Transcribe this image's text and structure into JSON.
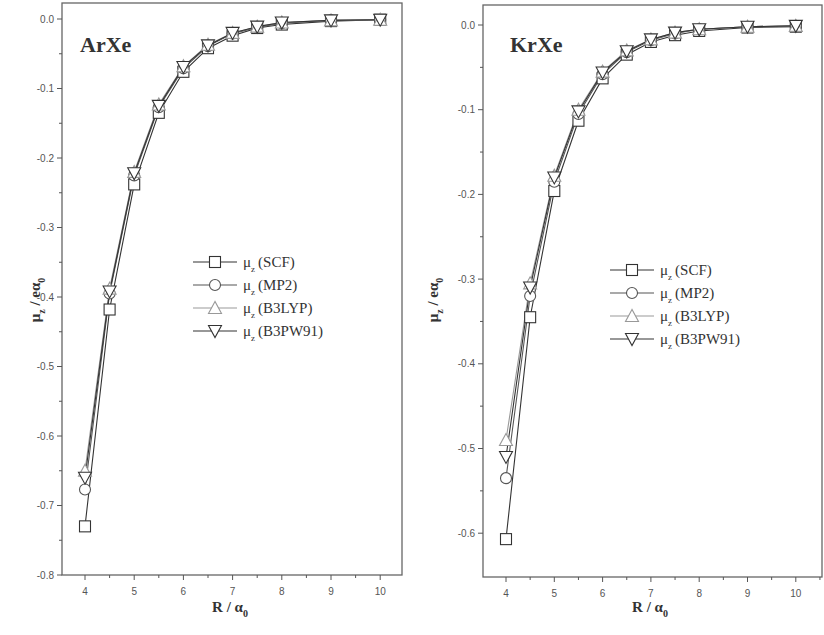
{
  "chart_data": [
    {
      "type": "line",
      "title": "ArXe",
      "xlabel": "R / α0",
      "ylabel": "μz / eα0",
      "xlim": [
        3.6,
        10.5
      ],
      "ylim": [
        -0.8,
        0.0
      ],
      "xticks": [
        4,
        5,
        6,
        7,
        8,
        9,
        10
      ],
      "yticks": [
        0.0,
        -0.1,
        -0.2,
        -0.3,
        -0.4,
        -0.5,
        -0.6,
        -0.7,
        -0.8
      ],
      "ytick_labels": [
        "0.0",
        "-0.1",
        "-0.2",
        "-0.3",
        "-0.4",
        "-0.5",
        "-0.6",
        "-0.7",
        "-0.8"
      ],
      "grid": false,
      "legend_position": "center-right",
      "x": [
        4.0,
        4.5,
        5.0,
        5.5,
        6.0,
        6.5,
        7.0,
        7.5,
        8.0,
        9.0,
        10.0
      ],
      "series": [
        {
          "name": "μz (SCF)",
          "marker": "square",
          "color": "#333333",
          "values": [
            -0.73,
            -0.418,
            -0.238,
            -0.135,
            -0.076,
            -0.042,
            -0.024,
            -0.013,
            -0.008,
            -0.003,
            -0.001
          ]
        },
        {
          "name": "μz (MP2)",
          "marker": "circle",
          "color": "#555555",
          "values": [
            -0.677,
            -0.395,
            -0.225,
            -0.127,
            -0.071,
            -0.039,
            -0.021,
            -0.012,
            -0.006,
            -0.002,
            -0.001
          ]
        },
        {
          "name": "μz (B3LYP)",
          "marker": "triangle-up",
          "color": "#999999",
          "values": [
            -0.65,
            -0.388,
            -0.22,
            -0.123,
            -0.068,
            -0.037,
            -0.02,
            -0.011,
            -0.005,
            -0.002,
            -0.001
          ]
        },
        {
          "name": "μz (B3PW91)",
          "marker": "triangle-down",
          "color": "#333333",
          "values": [
            -0.66,
            -0.392,
            -0.222,
            -0.125,
            -0.069,
            -0.038,
            -0.02,
            -0.011,
            -0.005,
            -0.002,
            -0.001
          ]
        }
      ]
    },
    {
      "type": "line",
      "title": "KrXe",
      "xlabel": "R / α0",
      "ylabel": "μz / eα0",
      "xlim": [
        3.6,
        10.5
      ],
      "ylim": [
        -0.65,
        0.02
      ],
      "xticks": [
        4,
        5,
        6,
        7,
        8,
        9,
        10
      ],
      "yticks": [
        0.0,
        -0.1,
        -0.2,
        -0.3,
        -0.4,
        -0.5,
        -0.6
      ],
      "ytick_labels": [
        "0.0",
        "-0.1",
        "-0.2",
        "-0.3",
        "-0.4",
        "-0.5",
        "-0.6"
      ],
      "grid": false,
      "legend_position": "center-right",
      "x": [
        4.0,
        4.5,
        5.0,
        5.5,
        6.0,
        6.5,
        7.0,
        7.5,
        8.0,
        9.0,
        10.0
      ],
      "series": [
        {
          "name": "μz (SCF)",
          "marker": "square",
          "color": "#333333",
          "values": [
            -0.607,
            -0.345,
            -0.196,
            -0.113,
            -0.063,
            -0.035,
            -0.02,
            -0.012,
            -0.007,
            -0.003,
            -0.002
          ]
        },
        {
          "name": "μz (MP2)",
          "marker": "circle",
          "color": "#555555",
          "values": [
            -0.535,
            -0.32,
            -0.185,
            -0.105,
            -0.058,
            -0.032,
            -0.018,
            -0.01,
            -0.005,
            -0.002,
            -0.001
          ]
        },
        {
          "name": "μz (B3LYP)",
          "marker": "triangle-up",
          "color": "#999999",
          "values": [
            -0.49,
            -0.305,
            -0.178,
            -0.1,
            -0.055,
            -0.03,
            -0.017,
            -0.009,
            -0.005,
            -0.002,
            -0.001
          ]
        },
        {
          "name": "μz (B3PW91)",
          "marker": "triangle-down",
          "color": "#333333",
          "values": [
            -0.51,
            -0.31,
            -0.18,
            -0.102,
            -0.056,
            -0.031,
            -0.017,
            -0.009,
            -0.005,
            -0.002,
            -0.001
          ]
        }
      ]
    }
  ],
  "panels": [
    {
      "title": "ArXe",
      "xlabel_main": "R / α",
      "xlabel_sub": "0",
      "ylabel_main": "μ",
      "ylabel_sub": "z",
      "ylabel_rest": " / eα",
      "ylabel_sub2": "0"
    },
    {
      "title": "KrXe",
      "xlabel_main": "R / α",
      "xlabel_sub": "0",
      "ylabel_main": "μ",
      "ylabel_sub": "z",
      "ylabel_rest": " / eα",
      "ylabel_sub2": "0"
    }
  ],
  "legend": [
    {
      "symbol": "μ",
      "sub": "z",
      "method": "(SCF)"
    },
    {
      "symbol": "μ",
      "sub": "z",
      "method": "(MP2)"
    },
    {
      "symbol": "μ",
      "sub": "z",
      "method": "(B3LYP)"
    },
    {
      "symbol": "μ",
      "sub": "z",
      "method": "(B3PW91)"
    }
  ]
}
